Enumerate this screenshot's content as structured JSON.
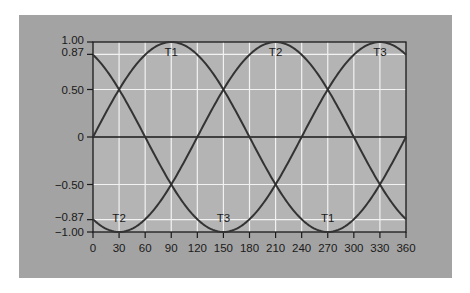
{
  "chart_data": {
    "type": "line",
    "title": "",
    "xlabel": "",
    "ylabel": "",
    "xlim": [
      0,
      360
    ],
    "ylim": [
      -1.0,
      1.0
    ],
    "grid": true,
    "legend": "none",
    "x_ticks": [
      0,
      30,
      60,
      90,
      120,
      150,
      180,
      210,
      240,
      270,
      300,
      330,
      360
    ],
    "x_tick_labels": [
      "0",
      "30",
      "60",
      "90",
      "120",
      "150",
      "180",
      "210",
      "240",
      "270",
      "300",
      "330",
      "360"
    ],
    "y_ticks": [
      1.0,
      0.87,
      0.5,
      0,
      -0.5,
      -0.87,
      -1.0
    ],
    "y_tick_labels": [
      "1.00",
      "0.87",
      "0.50",
      "0",
      "−0.50",
      "−0.87",
      "−1.00"
    ],
    "x": [
      0,
      30,
      60,
      90,
      120,
      150,
      180,
      210,
      240,
      270,
      300,
      330,
      360
    ],
    "series": [
      {
        "name": "T1",
        "formula": "sin(x)",
        "phase_deg": 0,
        "values": [
          0,
          0.5,
          0.87,
          1.0,
          0.87,
          0.5,
          0,
          -0.5,
          -0.87,
          -1.0,
          -0.87,
          -0.5,
          0
        ]
      },
      {
        "name": "T2",
        "formula": "sin(x-120)",
        "phase_deg": 120,
        "values": [
          -0.87,
          -1.0,
          -0.87,
          -0.5,
          0,
          0.5,
          0.87,
          1.0,
          0.87,
          0.5,
          0,
          -0.5,
          -0.87
        ]
      },
      {
        "name": "T3",
        "formula": "sin(x-240)",
        "phase_deg": 240,
        "values": [
          0.87,
          0.5,
          0,
          -0.5,
          -0.87,
          -1.0,
          -0.87,
          -0.5,
          0,
          0.5,
          0.87,
          1.0,
          0.87
        ]
      }
    ],
    "annotations": [
      {
        "text": "T1",
        "x": 90,
        "y": 0.87,
        "position": "below-peak"
      },
      {
        "text": "T2",
        "x": 210,
        "y": 0.87,
        "position": "below-peak"
      },
      {
        "text": "T3",
        "x": 330,
        "y": 0.87,
        "position": "below-peak"
      },
      {
        "text": "T2",
        "x": 30,
        "y": -0.87,
        "position": "above-trough"
      },
      {
        "text": "T3",
        "x": 150,
        "y": -0.87,
        "position": "above-trough"
      },
      {
        "text": "T1",
        "x": 270,
        "y": -0.87,
        "position": "above-trough"
      }
    ]
  },
  "colors": {
    "panel_bg": "#a3a3a3",
    "plot_bg": "#b4b4b4",
    "grid": "#f2f2f2",
    "axis": "#1a1a1a",
    "curve": "#333333"
  }
}
